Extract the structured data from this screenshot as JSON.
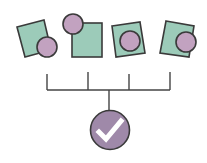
{
  "diagram": {
    "colors": {
      "square_fill": "#9ccbb9",
      "circle_fill": "#c2a2c0",
      "stroke": "#3a3a3a",
      "check_circle_fill": "#9f89a9",
      "check_mark": "#ffffff",
      "connector": "#444444"
    },
    "items": [
      {
        "id": "item-1",
        "circle_position": "bottom-right"
      },
      {
        "id": "item-2",
        "circle_position": "top-left"
      },
      {
        "id": "item-3",
        "circle_position": "center"
      },
      {
        "id": "item-4",
        "circle_position": "right"
      }
    ],
    "result": {
      "icon": "check-icon"
    }
  }
}
